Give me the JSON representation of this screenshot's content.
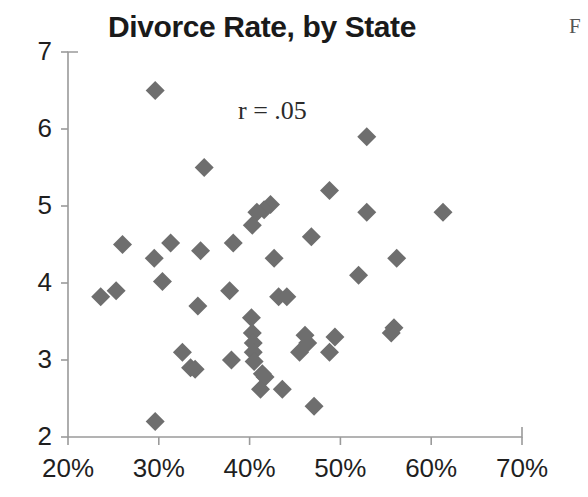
{
  "figure": {
    "title": "Divorce Rate, by State",
    "edge_fragment": "F"
  },
  "annotation": {
    "correlation_label": "r = .05"
  },
  "axes": {
    "y_tick_labels": [
      "7",
      "6",
      "5",
      "4",
      "3",
      "2"
    ],
    "x_tick_labels": [
      "20%",
      "30%",
      "40%",
      "50%",
      "60%",
      "70%"
    ]
  },
  "colors": {
    "marker": "#6e6e6e",
    "axis": "#9a9a9a",
    "title": "#1a1a1a",
    "tick_text": "#1f1f1f",
    "background": "#ffffff"
  },
  "chart_data": {
    "type": "scatter",
    "title": "Divorce Rate, by State",
    "xlabel": "",
    "ylabel": "",
    "xlim": [
      20,
      70
    ],
    "ylim": [
      2,
      7
    ],
    "xtick_values": [
      20,
      30,
      40,
      50,
      60,
      70
    ],
    "ytick_values": [
      2,
      3,
      4,
      5,
      6,
      7
    ],
    "x_unit": "percent",
    "grid": false,
    "legend": null,
    "annotations": [
      {
        "text": "r = .05",
        "x": 39.5,
        "y": 5.95
      }
    ],
    "marker_symbol": "diamond",
    "marker_color": "#6e6e6e",
    "points": [
      {
        "x": 29.6,
        "y": 6.5
      },
      {
        "x": 52.9,
        "y": 5.9
      },
      {
        "x": 35.0,
        "y": 5.5
      },
      {
        "x": 48.8,
        "y": 5.2
      },
      {
        "x": 42.3,
        "y": 5.02
      },
      {
        "x": 41.6,
        "y": 4.95
      },
      {
        "x": 40.8,
        "y": 4.92
      },
      {
        "x": 52.9,
        "y": 4.92
      },
      {
        "x": 61.3,
        "y": 4.92
      },
      {
        "x": 40.3,
        "y": 4.75
      },
      {
        "x": 46.8,
        "y": 4.6
      },
      {
        "x": 26.0,
        "y": 4.5
      },
      {
        "x": 31.3,
        "y": 4.52
      },
      {
        "x": 38.2,
        "y": 4.52
      },
      {
        "x": 34.6,
        "y": 4.42
      },
      {
        "x": 29.5,
        "y": 4.32
      },
      {
        "x": 42.7,
        "y": 4.32
      },
      {
        "x": 56.2,
        "y": 4.32
      },
      {
        "x": 52.0,
        "y": 4.1
      },
      {
        "x": 30.4,
        "y": 4.02
      },
      {
        "x": 23.6,
        "y": 3.82
      },
      {
        "x": 25.3,
        "y": 3.9
      },
      {
        "x": 37.8,
        "y": 3.9
      },
      {
        "x": 43.2,
        "y": 3.82
      },
      {
        "x": 44.1,
        "y": 3.82
      },
      {
        "x": 34.3,
        "y": 3.7
      },
      {
        "x": 40.2,
        "y": 3.55
      },
      {
        "x": 55.9,
        "y": 3.42
      },
      {
        "x": 55.6,
        "y": 3.35
      },
      {
        "x": 40.3,
        "y": 3.35
      },
      {
        "x": 46.1,
        "y": 3.32
      },
      {
        "x": 49.4,
        "y": 3.3
      },
      {
        "x": 40.4,
        "y": 3.22
      },
      {
        "x": 46.4,
        "y": 3.22
      },
      {
        "x": 32.6,
        "y": 3.1
      },
      {
        "x": 40.4,
        "y": 3.1
      },
      {
        "x": 45.5,
        "y": 3.1
      },
      {
        "x": 48.8,
        "y": 3.1
      },
      {
        "x": 38.0,
        "y": 3.0
      },
      {
        "x": 40.5,
        "y": 2.98
      },
      {
        "x": 33.5,
        "y": 2.9
      },
      {
        "x": 34.0,
        "y": 2.88
      },
      {
        "x": 41.4,
        "y": 2.82
      },
      {
        "x": 41.7,
        "y": 2.78
      },
      {
        "x": 41.2,
        "y": 2.62
      },
      {
        "x": 43.6,
        "y": 2.62
      },
      {
        "x": 47.1,
        "y": 2.4
      },
      {
        "x": 29.6,
        "y": 2.2
      }
    ]
  }
}
